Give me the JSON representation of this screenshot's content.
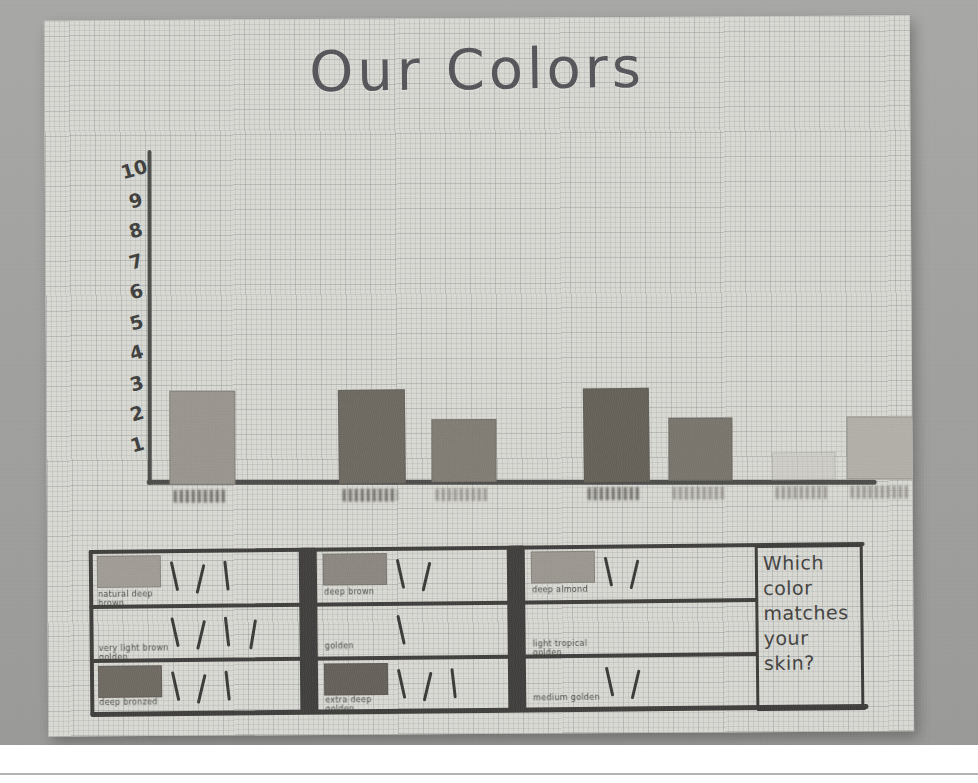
{
  "poster": {
    "title": "Our Colors",
    "question": "Which color matches your skin?"
  },
  "chart_data": {
    "type": "bar",
    "title": "Our Colors",
    "xlabel": "",
    "ylabel": "",
    "ylim": [
      0,
      10
    ],
    "grid": true,
    "y_ticks": [
      "10",
      "9",
      "8",
      "7",
      "6",
      "5",
      "4",
      "3",
      "2",
      "1"
    ],
    "categories": [
      "natural deep brown",
      "very light brown",
      "golden",
      "medium brown",
      "deep bronzed",
      "extra deep brown",
      "light tropical golden"
    ],
    "category_labels_legible": false,
    "values": [
      3,
      3,
      2,
      3,
      2,
      0,
      2
    ],
    "bar_colors": [
      "#9b9790",
      "#6e6a62",
      "#827d75",
      "#666259",
      "#7a756d",
      "#c9c6bf",
      "#b4b1aa"
    ]
  },
  "tally_table": {
    "rows": [
      {
        "swatch_label": "natural deep brown",
        "swatch_color": "#a29e97",
        "tallies": 3,
        "swatch_label_mid": "deep brown",
        "swatch_color_mid": "#8d8881",
        "tallies_mid": 2,
        "swatch_label_right": "deep almond",
        "swatch_color_right": "#9d9992",
        "tallies_right": 2
      },
      {
        "swatch_label": "very light brown golden",
        "swatch_color": "",
        "tallies": 4,
        "swatch_label_mid": "golden",
        "swatch_color_mid": "",
        "tallies_mid": 1,
        "swatch_label_right": "light tropical golden",
        "swatch_color_right": "",
        "tallies_right": 0
      },
      {
        "swatch_label": "deep bronzed",
        "swatch_color": "#6f6a62",
        "tallies": 3,
        "swatch_label_mid": "extra deep golden",
        "swatch_color_mid": "#66615a",
        "tallies_mid": 3,
        "swatch_label_right": "medium golden",
        "swatch_color_right": "",
        "tallies_right": 2
      }
    ]
  },
  "colors": {
    "mat": "#a7a7a5",
    "paper": "#dcdcd6",
    "ink": "#4a4a48"
  }
}
